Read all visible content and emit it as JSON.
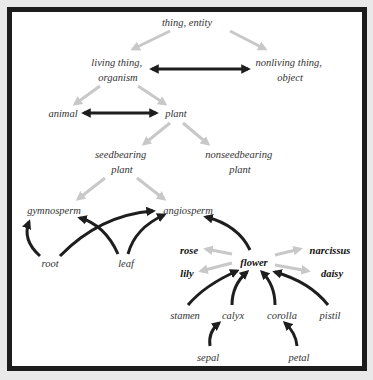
{
  "colors": {
    "background": "#e9e9e9",
    "frame": "#1c1c1c",
    "panel": "#ffffff",
    "is_a_arrow": "#c8c8c8",
    "relation_arrow": "#1e1e1e"
  },
  "nodes": {
    "thing": [
      "thing, entity"
    ],
    "living": [
      "living thing,",
      "organism"
    ],
    "nonliving": [
      "nonliving thing,",
      "object"
    ],
    "animal": [
      "animal"
    ],
    "plant": [
      "plant"
    ],
    "seedbearing": [
      "seedbearing",
      "plant"
    ],
    "nonseedbearing": [
      "nonseedbearing",
      "plant"
    ],
    "gymnosperm": [
      "gymnosperm"
    ],
    "angiosperm": [
      "angiosperm"
    ],
    "root": [
      "root"
    ],
    "leaf": [
      "leaf"
    ],
    "rose": [
      "rose"
    ],
    "flower": [
      "flower"
    ],
    "narcissus": [
      "narcissus"
    ],
    "lily": [
      "lily"
    ],
    "daisy": [
      "daisy"
    ],
    "stamen": [
      "stamen"
    ],
    "calyx": [
      "calyx"
    ],
    "corolla": [
      "corolla"
    ],
    "pistil": [
      "pistil"
    ],
    "sepal": [
      "sepal"
    ],
    "petal": [
      "petal"
    ]
  },
  "edges": [
    {
      "from": "thing",
      "to": "living",
      "type": "is-a"
    },
    {
      "from": "thing",
      "to": "nonliving",
      "type": "is-a"
    },
    {
      "from": "living",
      "to": "nonliving",
      "type": "antonym"
    },
    {
      "from": "living",
      "to": "animal",
      "type": "is-a"
    },
    {
      "from": "living",
      "to": "plant",
      "type": "is-a"
    },
    {
      "from": "animal",
      "to": "plant",
      "type": "antonym"
    },
    {
      "from": "plant",
      "to": "seedbearing",
      "type": "is-a"
    },
    {
      "from": "plant",
      "to": "nonseedbearing",
      "type": "is-a"
    },
    {
      "from": "seedbearing",
      "to": "gymnosperm",
      "type": "is-a"
    },
    {
      "from": "seedbearing",
      "to": "angiosperm",
      "type": "is-a"
    },
    {
      "from": "root",
      "to": "gymnosperm",
      "type": "part-of"
    },
    {
      "from": "root",
      "to": "angiosperm",
      "type": "part-of"
    },
    {
      "from": "leaf",
      "to": "gymnosperm",
      "type": "part-of"
    },
    {
      "from": "leaf",
      "to": "angiosperm",
      "type": "part-of"
    },
    {
      "from": "flower",
      "to": "angiosperm",
      "type": "part-of"
    },
    {
      "from": "flower",
      "to": "rose",
      "type": "is-a"
    },
    {
      "from": "flower",
      "to": "lily",
      "type": "is-a"
    },
    {
      "from": "flower",
      "to": "narcissus",
      "type": "is-a"
    },
    {
      "from": "flower",
      "to": "daisy",
      "type": "is-a"
    },
    {
      "from": "stamen",
      "to": "flower",
      "type": "part-of"
    },
    {
      "from": "calyx",
      "to": "flower",
      "type": "part-of"
    },
    {
      "from": "corolla",
      "to": "flower",
      "type": "part-of"
    },
    {
      "from": "pistil",
      "to": "flower",
      "type": "part-of"
    },
    {
      "from": "sepal",
      "to": "calyx",
      "type": "part-of"
    },
    {
      "from": "petal",
      "to": "corolla",
      "type": "part-of"
    }
  ]
}
